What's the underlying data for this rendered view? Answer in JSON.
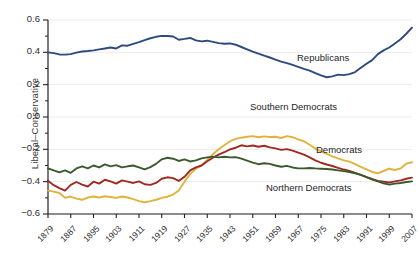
{
  "chart_data": {
    "type": "line",
    "title": "",
    "xlabel": "",
    "ylabel": "Liberal–Conservative",
    "xlim": [
      1879,
      2007
    ],
    "ylim": [
      -0.6,
      0.6
    ],
    "grid": true,
    "legend_position": "inline-annotations",
    "x_ticks": [
      "1879",
      "1887",
      "1895",
      "1903",
      "1911",
      "1919",
      "1927",
      "1935",
      "1943",
      "1951",
      "1959",
      "1967",
      "1975",
      "1983",
      "1991",
      "1999",
      "2007"
    ],
    "y_ticks": [
      "0.6",
      "0.4",
      "0.2",
      "0.0",
      "-0.2",
      "-0.4",
      "-0.6"
    ],
    "y_minor_ticks": [
      0.5,
      0.3,
      0.1,
      -0.1,
      -0.3,
      -0.5
    ],
    "x": [
      1879,
      1881,
      1883,
      1885,
      1887,
      1889,
      1891,
      1893,
      1895,
      1897,
      1899,
      1901,
      1903,
      1905,
      1907,
      1909,
      1911,
      1913,
      1915,
      1917,
      1919,
      1921,
      1923,
      1925,
      1927,
      1929,
      1931,
      1933,
      1935,
      1937,
      1939,
      1941,
      1943,
      1945,
      1947,
      1949,
      1951,
      1953,
      1955,
      1957,
      1959,
      1961,
      1963,
      1965,
      1967,
      1969,
      1971,
      1973,
      1975,
      1977,
      1979,
      1981,
      1983,
      1985,
      1987,
      1989,
      1991,
      1993,
      1995,
      1997,
      1999,
      2001,
      2003,
      2005,
      2007
    ],
    "series": [
      {
        "name": "Republicans",
        "color": "#2e4a7d",
        "values": [
          0.4,
          0.395,
          0.387,
          0.386,
          0.389,
          0.398,
          0.405,
          0.408,
          0.412,
          0.418,
          0.424,
          0.43,
          0.424,
          0.443,
          0.441,
          0.452,
          0.463,
          0.475,
          0.487,
          0.496,
          0.502,
          0.501,
          0.498,
          0.478,
          0.483,
          0.489,
          0.474,
          0.468,
          0.472,
          0.465,
          0.457,
          0.453,
          0.455,
          0.447,
          0.433,
          0.419,
          0.404,
          0.392,
          0.38,
          0.368,
          0.355,
          0.343,
          0.333,
          0.322,
          0.31,
          0.298,
          0.287,
          0.272,
          0.257,
          0.246,
          0.251,
          0.262,
          0.259,
          0.265,
          0.278,
          0.304,
          0.329,
          0.352,
          0.389,
          0.412,
          0.43,
          0.455,
          0.481,
          0.515,
          0.553
        ]
      },
      {
        "name": "Southern Democrats",
        "color": "#e0b33c",
        "values": [
          -0.455,
          -0.462,
          -0.47,
          -0.5,
          -0.492,
          -0.505,
          -0.512,
          -0.498,
          -0.492,
          -0.498,
          -0.49,
          -0.495,
          -0.5,
          -0.492,
          -0.498,
          -0.508,
          -0.52,
          -0.527,
          -0.52,
          -0.512,
          -0.5,
          -0.493,
          -0.48,
          -0.455,
          -0.4,
          -0.352,
          -0.32,
          -0.3,
          -0.265,
          -0.23,
          -0.2,
          -0.175,
          -0.15,
          -0.135,
          -0.128,
          -0.122,
          -0.118,
          -0.125,
          -0.12,
          -0.124,
          -0.122,
          -0.13,
          -0.118,
          -0.125,
          -0.138,
          -0.15,
          -0.172,
          -0.195,
          -0.212,
          -0.228,
          -0.243,
          -0.256,
          -0.268,
          -0.276,
          -0.292,
          -0.308,
          -0.324,
          -0.34,
          -0.348,
          -0.334,
          -0.32,
          -0.328,
          -0.318,
          -0.288,
          -0.28
        ]
      },
      {
        "name": "Democrats",
        "color": "#9e2a24",
        "values": [
          -0.395,
          -0.422,
          -0.44,
          -0.455,
          -0.42,
          -0.402,
          -0.418,
          -0.43,
          -0.4,
          -0.412,
          -0.388,
          -0.398,
          -0.412,
          -0.392,
          -0.4,
          -0.408,
          -0.398,
          -0.416,
          -0.42,
          -0.408,
          -0.382,
          -0.373,
          -0.378,
          -0.395,
          -0.37,
          -0.33,
          -0.312,
          -0.3,
          -0.274,
          -0.252,
          -0.233,
          -0.218,
          -0.2,
          -0.19,
          -0.175,
          -0.182,
          -0.176,
          -0.184,
          -0.178,
          -0.188,
          -0.194,
          -0.203,
          -0.199,
          -0.208,
          -0.22,
          -0.233,
          -0.25,
          -0.268,
          -0.283,
          -0.294,
          -0.303,
          -0.315,
          -0.325,
          -0.333,
          -0.345,
          -0.358,
          -0.372,
          -0.385,
          -0.395,
          -0.4,
          -0.405,
          -0.398,
          -0.392,
          -0.382,
          -0.375
        ]
      },
      {
        "name": "Northern Democrats",
        "color": "#3a5a2e",
        "values": [
          -0.318,
          -0.33,
          -0.342,
          -0.33,
          -0.345,
          -0.318,
          -0.305,
          -0.318,
          -0.3,
          -0.312,
          -0.293,
          -0.305,
          -0.298,
          -0.312,
          -0.305,
          -0.3,
          -0.312,
          -0.324,
          -0.31,
          -0.29,
          -0.262,
          -0.252,
          -0.258,
          -0.272,
          -0.262,
          -0.275,
          -0.268,
          -0.256,
          -0.25,
          -0.245,
          -0.25,
          -0.246,
          -0.25,
          -0.248,
          -0.258,
          -0.27,
          -0.282,
          -0.292,
          -0.286,
          -0.29,
          -0.3,
          -0.308,
          -0.302,
          -0.312,
          -0.318,
          -0.318,
          -0.315,
          -0.318,
          -0.32,
          -0.322,
          -0.325,
          -0.33,
          -0.335,
          -0.34,
          -0.348,
          -0.358,
          -0.372,
          -0.385,
          -0.398,
          -0.41,
          -0.418,
          -0.412,
          -0.408,
          -0.402,
          -0.398
        ]
      }
    ],
    "annotations": [
      {
        "text": "Republicans",
        "x_px": 297,
        "y_px": 52
      },
      {
        "text": "Southern Democrats",
        "x_px": 250,
        "y_px": 101
      },
      {
        "text": "Democrats",
        "x_px": 316,
        "y_px": 144
      },
      {
        "text": "Northern Democrats",
        "x_px": 266,
        "y_px": 182
      }
    ]
  }
}
